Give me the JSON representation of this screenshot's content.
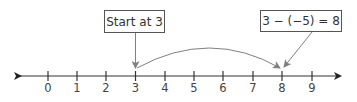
{
  "diagram": {
    "type": "number-line",
    "ticks": [
      "0",
      "1",
      "2",
      "3",
      "4",
      "5",
      "6",
      "7",
      "8",
      "9"
    ],
    "start_box": {
      "label": "Start at 3",
      "points_to": "3"
    },
    "result_box": {
      "label": "3 − (−5) = 8",
      "points_to": "8"
    },
    "jump": {
      "from": "3",
      "to": "8"
    },
    "colors": {
      "axis": "#333333",
      "arrow": "#808080",
      "box_border": "#555555",
      "text": "#333333"
    }
  }
}
